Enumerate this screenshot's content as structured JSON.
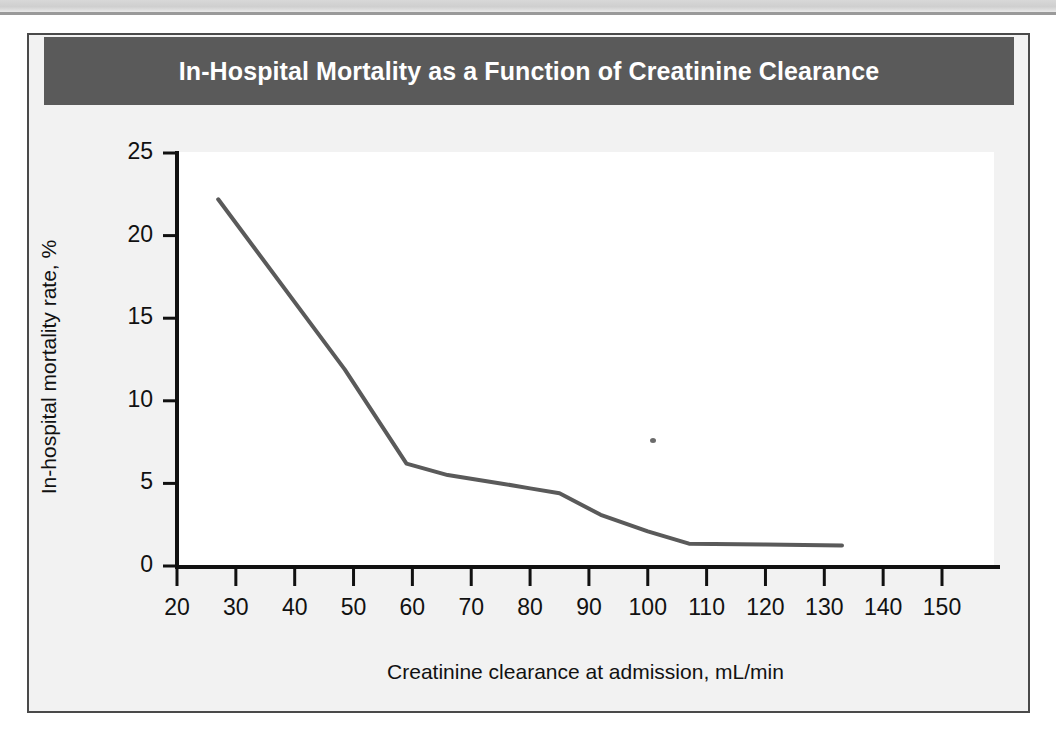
{
  "figure": {
    "title": "In-Hospital Mortality as a Function of Creatinine Clearance",
    "title_bar_color": "#5a5a5a",
    "title_text_color": "#ffffff",
    "frame_color": "#4a4a4a",
    "panel_background": "#f2f2f2",
    "plot_background": "#ffffff"
  },
  "chart_data": {
    "type": "line",
    "title": "In-Hospital Mortality as a Function of Creatinine Clearance",
    "subtitle": "",
    "xlabel": "Creatinine clearance at admission, mL/min",
    "ylabel": "In-hospital mortality rate, %",
    "xlim": [
      17,
      156
    ],
    "ylim": [
      0,
      25
    ],
    "xticks": [
      20,
      30,
      40,
      50,
      60,
      70,
      80,
      90,
      100,
      110,
      120,
      130,
      140,
      150
    ],
    "yticks": [
      0,
      5,
      10,
      15,
      20,
      25
    ],
    "xtick_labels": [
      "20",
      "30",
      "40",
      "50",
      "60",
      "70",
      "80",
      "90",
      "100",
      "110",
      "120",
      "130",
      "140",
      "150"
    ],
    "ytick_labels": [
      "0",
      "5",
      "10",
      "15",
      "20",
      "25"
    ],
    "grid": false,
    "legend": null,
    "legend_position": "none",
    "annotations": [],
    "line_color": "#5a5a5a",
    "line_width": 4,
    "series": [
      {
        "name": "In-hospital mortality rate",
        "x": [
          27.0,
          48.5,
          59.0,
          66.0,
          75.0,
          80.0,
          85.0,
          92.0,
          100.0,
          107.0,
          120.0,
          133.0
        ],
        "y": [
          22.2,
          11.9,
          6.2,
          5.5,
          5.0,
          4.7,
          4.4,
          3.1,
          2.1,
          1.35,
          1.3,
          1.25
        ]
      }
    ]
  },
  "artifacts": {
    "speck_label": "scan-speck"
  }
}
